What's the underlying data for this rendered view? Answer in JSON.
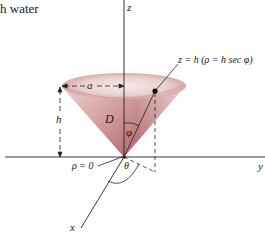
{
  "caption_fragment": "h water",
  "diagram": {
    "type": "3d-cone-spherical-coordinates",
    "colors": {
      "cone_fill_light": "#f3e2e2",
      "cone_fill_mid": "#d9a3a3",
      "cone_fill_dark": "#a85a5e",
      "axes": "#222222"
    },
    "axes": {
      "z_label": "z",
      "y_label": "y",
      "x_label": "x"
    },
    "labels": {
      "radius": "a",
      "height": "h",
      "region": "D",
      "polar_angle": "φ",
      "azimuth": "θ",
      "origin": "ρ = 0",
      "top_plane": "z = h  (ρ = h sec φ)"
    }
  }
}
